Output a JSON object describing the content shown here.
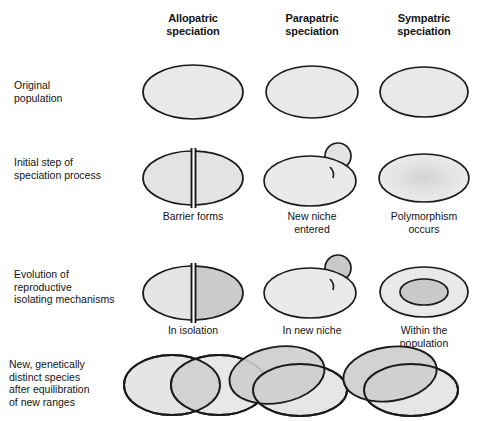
{
  "figure": {
    "columns": [
      {
        "id": "allopatric",
        "label": "Allopatric\nspeciation",
        "cx": 193
      },
      {
        "id": "parapatric",
        "label": "Parapatric\nspeciation",
        "cx": 312
      },
      {
        "id": "sympatric",
        "label": "Sympatric\nspeciation",
        "cx": 424
      }
    ],
    "rows": [
      {
        "id": "original-population",
        "label": "Original\npopulation",
        "cy": 92
      },
      {
        "id": "initial-step",
        "label": "Initial step of\nspeciation process",
        "cy": 175
      },
      {
        "id": "evolution-isolating",
        "label": "Evolution of\nreproductive\nisolating mechanisms",
        "cy": 290
      },
      {
        "id": "new-species",
        "label": "New, genetically\ndistinct species\nafter equilibration\nof new ranges",
        "cy": 385
      }
    ],
    "captions": {
      "allopatric_step2": "Barrier forms",
      "parapatric_step2": "New niche\nentered",
      "sympatric_step2": "Polymorphism\noccurs",
      "allopatric_step3": "In isolation",
      "parapatric_step3": "In new niche",
      "sympatric_step3": "Within the\npopulation"
    },
    "colors": {
      "outline": "#1a1a1a",
      "fill_light": "#e9e9e9",
      "fill_medium": "#d6d6d6",
      "fill_dark": "#bfbfbf",
      "overlap": "#cfcfcf",
      "background": "#ffffff",
      "text": "#141414"
    },
    "shapes": {
      "original_population": "plain ellipse",
      "allopatric_barrier": "ellipse split by vertical barrier",
      "parapatric_bud": "ellipse with small circular bud at upper right",
      "sympatric_polymorphism": "ellipse with diffuse interior shading",
      "sympatric_nested": "ellipse with darker inner ellipse",
      "overlapping_ranges": "two overlapping ellipses"
    }
  }
}
